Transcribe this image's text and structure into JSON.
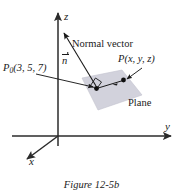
{
  "figure": {
    "caption": "Figure 12-5b",
    "axes": {
      "z_label": "z",
      "y_label": "y",
      "x_label": "x"
    },
    "labels": {
      "normal_vector": "Normal vector",
      "normal_symbol": "n",
      "plane": "Plane",
      "point_p0_name": "P",
      "point_p0_sub": "0",
      "point_p0_coords": "(3, 5, 7)",
      "point_p_name": "P",
      "point_p_coords": "(x, y, z)"
    },
    "colors": {
      "plane_fill": "#d2d2dc",
      "plane_stroke": "#b9b9c6",
      "ink": "#1a1a1a",
      "axis": "#2b2b2b",
      "background": "#ffffff"
    }
  }
}
